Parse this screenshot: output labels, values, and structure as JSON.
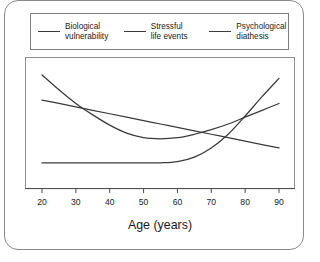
{
  "chart_data": {
    "type": "line",
    "title": "",
    "subtitle": "",
    "xlabel": "Age (years)",
    "ylabel": "",
    "xlim": [
      20,
      90
    ],
    "ylim": [
      0,
      100
    ],
    "xticks": [
      20,
      30,
      40,
      50,
      60,
      70,
      80,
      90
    ],
    "xticklabels": [
      "20",
      "30",
      "40",
      "50",
      "60",
      "70",
      "80",
      "90"
    ],
    "yticks": [],
    "yticklabels": [],
    "grid": false,
    "legend_position": "top",
    "line_color": "#3a3a3a",
    "frame_color": "#8d8d8d",
    "background": "#ffffff",
    "x": [
      20,
      25,
      30,
      35,
      40,
      45,
      50,
      55,
      60,
      65,
      70,
      75,
      80,
      85,
      90
    ],
    "series": [
      {
        "name": "Biological vulnerability",
        "values": [
          93,
          80,
          68,
          58,
          49,
          42,
          38,
          37,
          38,
          41,
          45,
          50,
          56,
          62,
          68
        ]
      },
      {
        "name": "Stressful life events",
        "values": [
          71,
          68,
          65,
          62,
          59,
          56,
          53,
          50,
          47,
          44,
          41,
          38,
          35,
          32,
          29
        ]
      },
      {
        "name": "Psychological diathesis",
        "values": [
          16,
          16,
          16,
          16,
          16,
          16,
          16,
          16,
          17,
          21,
          29,
          41,
          57,
          74,
          90
        ]
      }
    ]
  },
  "legend": {
    "items": [
      {
        "label": "Biological\nvulnerability"
      },
      {
        "label": "Stressful\nlife events"
      },
      {
        "label": "Psychological\ndiathesis"
      }
    ]
  }
}
